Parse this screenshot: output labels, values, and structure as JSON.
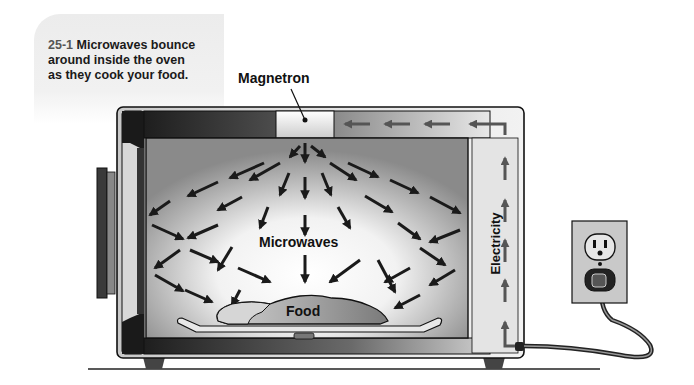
{
  "figure": {
    "number": "25-1",
    "caption_text": "Microwaves bounce around inside the oven as they cook your food."
  },
  "labels": {
    "magnetron": "Magnetron",
    "microwaves": "Microwaves",
    "food": "Food",
    "electricity": "Electricity"
  },
  "colors": {
    "outline": "#1a1a1a",
    "arrow": "#1a1a1a",
    "electricity_arrow": "#555555",
    "caption_bg": "#eeeeee",
    "oven_body": "#d8d8d8",
    "cavity_center": "#ffffff",
    "cavity_edge": "#8c8c8c"
  }
}
